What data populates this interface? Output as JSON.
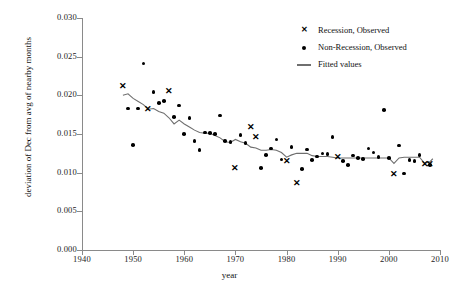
{
  "chart_data": {
    "type": "scatter",
    "title": "",
    "xlabel": "year",
    "ylabel": "deviation of Dec from avg of nearby months",
    "xlim": [
      1940,
      2010
    ],
    "ylim": [
      0.0,
      0.03
    ],
    "xticks": [
      1940,
      1950,
      1960,
      1970,
      1980,
      1990,
      2000,
      2010
    ],
    "yticks": [
      "0.000",
      "0.005",
      "0.010",
      "0.015",
      "0.020",
      "0.025",
      "0.030"
    ],
    "grid": false,
    "legend_position": "top-right",
    "legend": [
      {
        "label": "Recession, Observed",
        "marker": "x"
      },
      {
        "label": "Non-Recession, Observed",
        "marker": "dot"
      },
      {
        "label": "Fitted values",
        "marker": "line"
      }
    ],
    "series": [
      {
        "name": "Recession, Observed",
        "marker": "x",
        "color": "#000000",
        "points": [
          {
            "x": 1948,
            "y": 0.0212
          },
          {
            "x": 1953,
            "y": 0.0182
          },
          {
            "x": 1957,
            "y": 0.0205
          },
          {
            "x": 1970,
            "y": 0.0106
          },
          {
            "x": 1973,
            "y": 0.0158
          },
          {
            "x": 1974,
            "y": 0.0146
          },
          {
            "x": 1980,
            "y": 0.0114
          },
          {
            "x": 1982,
            "y": 0.0086
          },
          {
            "x": 1990,
            "y": 0.012
          },
          {
            "x": 2001,
            "y": 0.0097
          },
          {
            "x": 2007,
            "y": 0.011
          },
          {
            "x": 2008,
            "y": 0.0111
          }
        ]
      },
      {
        "name": "Non-Recession, Observed",
        "marker": "dot",
        "color": "#000000",
        "points": [
          {
            "x": 1949,
            "y": 0.0183
          },
          {
            "x": 1950,
            "y": 0.0136
          },
          {
            "x": 1951,
            "y": 0.0183
          },
          {
            "x": 1952,
            "y": 0.0241
          },
          {
            "x": 1954,
            "y": 0.0204
          },
          {
            "x": 1955,
            "y": 0.019
          },
          {
            "x": 1956,
            "y": 0.0193
          },
          {
            "x": 1958,
            "y": 0.0172
          },
          {
            "x": 1959,
            "y": 0.0187
          },
          {
            "x": 1960,
            "y": 0.015
          },
          {
            "x": 1961,
            "y": 0.0171
          },
          {
            "x": 1962,
            "y": 0.0141
          },
          {
            "x": 1963,
            "y": 0.0129
          },
          {
            "x": 1964,
            "y": 0.0152
          },
          {
            "x": 1965,
            "y": 0.0151
          },
          {
            "x": 1966,
            "y": 0.015
          },
          {
            "x": 1967,
            "y": 0.0174
          },
          {
            "x": 1968,
            "y": 0.0141
          },
          {
            "x": 1969,
            "y": 0.014
          },
          {
            "x": 1971,
            "y": 0.0149
          },
          {
            "x": 1972,
            "y": 0.0138
          },
          {
            "x": 1975,
            "y": 0.0106
          },
          {
            "x": 1976,
            "y": 0.0123
          },
          {
            "x": 1977,
            "y": 0.0131
          },
          {
            "x": 1978,
            "y": 0.0143
          },
          {
            "x": 1979,
            "y": 0.0117
          },
          {
            "x": 1981,
            "y": 0.0133
          },
          {
            "x": 1983,
            "y": 0.0105
          },
          {
            "x": 1984,
            "y": 0.013
          },
          {
            "x": 1985,
            "y": 0.0116
          },
          {
            "x": 1986,
            "y": 0.0121
          },
          {
            "x": 1987,
            "y": 0.0125
          },
          {
            "x": 1988,
            "y": 0.0124
          },
          {
            "x": 1989,
            "y": 0.0146
          },
          {
            "x": 1991,
            "y": 0.0115
          },
          {
            "x": 1992,
            "y": 0.011
          },
          {
            "x": 1993,
            "y": 0.0122
          },
          {
            "x": 1994,
            "y": 0.0119
          },
          {
            "x": 1995,
            "y": 0.0118
          },
          {
            "x": 1996,
            "y": 0.0131
          },
          {
            "x": 1997,
            "y": 0.0126
          },
          {
            "x": 1998,
            "y": 0.012
          },
          {
            "x": 1999,
            "y": 0.0181
          },
          {
            "x": 2000,
            "y": 0.0119
          },
          {
            "x": 2002,
            "y": 0.0135
          },
          {
            "x": 2003,
            "y": 0.0099
          },
          {
            "x": 2004,
            "y": 0.0116
          },
          {
            "x": 2005,
            "y": 0.0115
          },
          {
            "x": 2006,
            "y": 0.0123
          },
          {
            "x": 2008,
            "y": 0.011
          }
        ]
      }
    ],
    "fitted_line": {
      "name": "Fitted values",
      "color": "#6f6f6f",
      "points": [
        {
          "x": 1948.0,
          "y": 0.02
        },
        {
          "x": 1949.0,
          "y": 0.0202
        },
        {
          "x": 1950.0,
          "y": 0.0196
        },
        {
          "x": 1951.0,
          "y": 0.0192
        },
        {
          "x": 1952.0,
          "y": 0.0188
        },
        {
          "x": 1953.0,
          "y": 0.0182
        },
        {
          "x": 1954.0,
          "y": 0.0183
        },
        {
          "x": 1955.0,
          "y": 0.0179
        },
        {
          "x": 1956.0,
          "y": 0.0177
        },
        {
          "x": 1957.0,
          "y": 0.0171
        },
        {
          "x": 1958.0,
          "y": 0.0163
        },
        {
          "x": 1959.0,
          "y": 0.0168
        },
        {
          "x": 1960.0,
          "y": 0.0163
        },
        {
          "x": 1961.0,
          "y": 0.0159
        },
        {
          "x": 1962.0,
          "y": 0.0155
        },
        {
          "x": 1963.0,
          "y": 0.0152
        },
        {
          "x": 1964.0,
          "y": 0.0151
        },
        {
          "x": 1965.0,
          "y": 0.0151
        },
        {
          "x": 1966.0,
          "y": 0.0148
        },
        {
          "x": 1967.0,
          "y": 0.0145
        },
        {
          "x": 1968.0,
          "y": 0.014
        },
        {
          "x": 1969.0,
          "y": 0.0139
        },
        {
          "x": 1970.0,
          "y": 0.0143
        },
        {
          "x": 1971.0,
          "y": 0.014
        },
        {
          "x": 1972.0,
          "y": 0.0138
        },
        {
          "x": 1973.0,
          "y": 0.0133
        },
        {
          "x": 1974.0,
          "y": 0.0132
        },
        {
          "x": 1975.0,
          "y": 0.0129
        },
        {
          "x": 1976.0,
          "y": 0.0129
        },
        {
          "x": 1977.0,
          "y": 0.013
        },
        {
          "x": 1978.0,
          "y": 0.0129
        },
        {
          "x": 1979.0,
          "y": 0.0126
        },
        {
          "x": 1980.0,
          "y": 0.012
        },
        {
          "x": 1981.0,
          "y": 0.0123
        },
        {
          "x": 1982.0,
          "y": 0.0125
        },
        {
          "x": 1983.0,
          "y": 0.0125
        },
        {
          "x": 1984.0,
          "y": 0.0125
        },
        {
          "x": 1985.0,
          "y": 0.0122
        },
        {
          "x": 1986.0,
          "y": 0.0121
        },
        {
          "x": 1987.0,
          "y": 0.0121
        },
        {
          "x": 1988.0,
          "y": 0.0121
        },
        {
          "x": 1989.0,
          "y": 0.012
        },
        {
          "x": 1990.0,
          "y": 0.0119
        },
        {
          "x": 1991.0,
          "y": 0.0119
        },
        {
          "x": 1992.0,
          "y": 0.0119
        },
        {
          "x": 1993.0,
          "y": 0.0119
        },
        {
          "x": 1994.0,
          "y": 0.0119
        },
        {
          "x": 1995.0,
          "y": 0.0119
        },
        {
          "x": 1996.0,
          "y": 0.0119
        },
        {
          "x": 1997.0,
          "y": 0.0119
        },
        {
          "x": 1998.0,
          "y": 0.0119
        },
        {
          "x": 1999.0,
          "y": 0.0119
        },
        {
          "x": 2000.0,
          "y": 0.0119
        },
        {
          "x": 2001.0,
          "y": 0.0112
        },
        {
          "x": 2002.0,
          "y": 0.0119
        },
        {
          "x": 2003.0,
          "y": 0.012
        },
        {
          "x": 2004.0,
          "y": 0.012
        },
        {
          "x": 2005.0,
          "y": 0.012
        },
        {
          "x": 2006.0,
          "y": 0.012
        },
        {
          "x": 2007.0,
          "y": 0.0112
        },
        {
          "x": 2008.0,
          "y": 0.0114
        },
        {
          "x": 2008.6,
          "y": 0.0118
        }
      ]
    },
    "axis_color": "#8a8a8a",
    "marker_color": "#000000"
  }
}
